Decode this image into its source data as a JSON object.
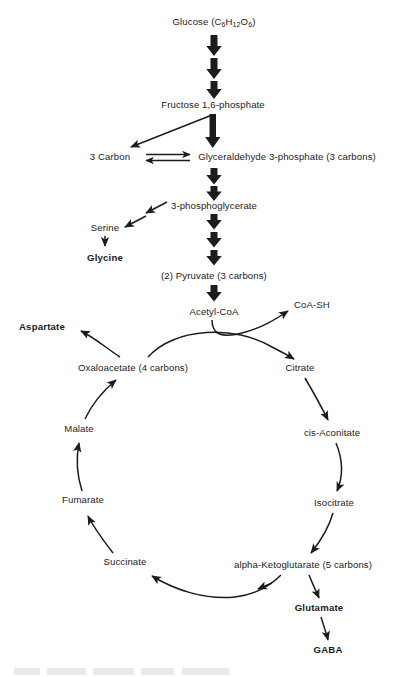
{
  "figure": {
    "background_color": "#ffffff",
    "stroke_color": "#1c1c1c"
  },
  "nodes": {
    "glucose": {
      "label": "Glucose (C6H12O6)",
      "text_main": "Glucose (C",
      "sub1": "6",
      "mid1": "H",
      "sub2": "12",
      "mid2": "O",
      "sub3": "6",
      "tail": ")",
      "x": 214,
      "y": 22,
      "bold": false
    },
    "fructose": {
      "label": "Fructose 1,6-phosphate",
      "x": 213,
      "y": 105,
      "bold": false
    },
    "three_carbon": {
      "label": "3 Carbon",
      "x": 110,
      "y": 157,
      "bold": false
    },
    "g3p": {
      "label": "Glyceraldehyde 3-phosphate (3 carbons)",
      "x": 287,
      "y": 157,
      "bold": false
    },
    "pg3": {
      "label": "3-phosphoglycerate",
      "x": 214,
      "y": 206,
      "bold": false
    },
    "serine": {
      "label": "Serine",
      "x": 105,
      "y": 228,
      "bold": false
    },
    "glycine": {
      "label": "Glycine",
      "x": 105,
      "y": 258,
      "bold": true
    },
    "pyruvate": {
      "label": "(2) Pyruvate (3 carbons)",
      "x": 214,
      "y": 276,
      "bold": false
    },
    "acetyl_coa": {
      "label": "Acetyl-CoA",
      "x": 214,
      "y": 312,
      "bold": false
    },
    "coa_sh": {
      "label": "CoA-SH",
      "x": 312,
      "y": 305,
      "bold": false
    },
    "aspartate": {
      "label": "Aspartate",
      "x": 42,
      "y": 327,
      "bold": true
    },
    "oxaloacetate": {
      "label": "Oxaloacetate (4 carbons)",
      "x": 133,
      "y": 368,
      "bold": false
    },
    "citrate": {
      "label": "Citrate",
      "x": 300,
      "y": 368,
      "bold": false
    },
    "malate": {
      "label": "Malate",
      "x": 79,
      "y": 429,
      "bold": false
    },
    "cis_aconitate": {
      "label": "cis-Aconitate",
      "x": 332,
      "y": 433,
      "bold": false
    },
    "fumarate": {
      "label": "Fumarate",
      "x": 83,
      "y": 500,
      "bold": false
    },
    "isocitrate": {
      "label": "Isocitrate",
      "x": 334,
      "y": 503,
      "bold": false
    },
    "succinate": {
      "label": "Succinate",
      "x": 125,
      "y": 562,
      "bold": false
    },
    "akg": {
      "label": "alpha-Ketoglutarate (5 carbons)",
      "x": 303,
      "y": 565,
      "bold": false
    },
    "glutamate": {
      "label": "Glutamate",
      "x": 319,
      "y": 608,
      "bold": true
    },
    "gaba": {
      "label": "GABA",
      "x": 328,
      "y": 650,
      "bold": true
    }
  },
  "edges": [
    {
      "name": "glucose-to-fructose-1",
      "type": "fat-down",
      "from": "glucose",
      "to": "fructose"
    },
    {
      "name": "glucose-to-fructose-2",
      "type": "fat-down",
      "from": "glucose",
      "to": "fructose"
    },
    {
      "name": "glucose-to-fructose-3",
      "type": "fat-down",
      "from": "glucose",
      "to": "fructose"
    },
    {
      "name": "fructose-to-three-carbon",
      "type": "straight",
      "from": "fructose",
      "to": "three_carbon"
    },
    {
      "name": "fructose-to-g3p",
      "type": "fat-down",
      "from": "fructose",
      "to": "g3p"
    },
    {
      "name": "three-carbon-g3p-equilibrium",
      "type": "double-headed",
      "from": "three_carbon",
      "to": "g3p"
    },
    {
      "name": "g3p-to-pg3-1",
      "type": "fat-down",
      "from": "g3p",
      "to": "pg3"
    },
    {
      "name": "g3p-to-pg3-2",
      "type": "fat-down",
      "from": "g3p",
      "to": "pg3"
    },
    {
      "name": "pg3-to-serine-1",
      "type": "diagonal",
      "from": "pg3",
      "to": "serine"
    },
    {
      "name": "pg3-to-serine-2",
      "type": "diagonal",
      "from": "pg3",
      "to": "serine"
    },
    {
      "name": "serine-to-glycine",
      "type": "straight",
      "from": "serine",
      "to": "glycine"
    },
    {
      "name": "pg3-to-pyruvate-1",
      "type": "fat-down",
      "from": "pg3",
      "to": "pyruvate"
    },
    {
      "name": "pg3-to-pyruvate-2",
      "type": "fat-down",
      "from": "pg3",
      "to": "pyruvate"
    },
    {
      "name": "pg3-to-pyruvate-3",
      "type": "fat-down",
      "from": "pg3",
      "to": "pyruvate"
    },
    {
      "name": "pyruvate-to-acetyl-coa",
      "type": "fat-down",
      "from": "pyruvate",
      "to": "acetyl_coa"
    },
    {
      "name": "acetyl-coa-to-coa-sh",
      "type": "curved",
      "from": "acetyl_coa",
      "to": "coa_sh"
    },
    {
      "name": "oxaloacetate-to-citrate",
      "type": "curved",
      "from": "oxaloacetate",
      "to": "citrate"
    },
    {
      "name": "oxaloacetate-to-aspartate",
      "type": "curved",
      "from": "oxaloacetate",
      "to": "aspartate"
    },
    {
      "name": "citrate-to-cis-aconitate",
      "type": "curved",
      "from": "citrate",
      "to": "cis_aconitate"
    },
    {
      "name": "cis-aconitate-to-isocitrate",
      "type": "curved",
      "from": "cis_aconitate",
      "to": "isocitrate"
    },
    {
      "name": "isocitrate-to-akg",
      "type": "curved",
      "from": "isocitrate",
      "to": "akg"
    },
    {
      "name": "akg-to-succinate",
      "type": "curved",
      "from": "akg",
      "to": "succinate"
    },
    {
      "name": "succinate-to-fumarate",
      "type": "curved",
      "from": "succinate",
      "to": "fumarate"
    },
    {
      "name": "fumarate-to-malate",
      "type": "curved",
      "from": "fumarate",
      "to": "malate"
    },
    {
      "name": "malate-to-oxaloacetate",
      "type": "curved",
      "from": "malate",
      "to": "oxaloacetate"
    },
    {
      "name": "akg-to-glutamate",
      "type": "curved",
      "from": "akg",
      "to": "glutamate"
    },
    {
      "name": "glutamate-to-gaba",
      "type": "curved",
      "from": "glutamate",
      "to": "gaba"
    }
  ]
}
